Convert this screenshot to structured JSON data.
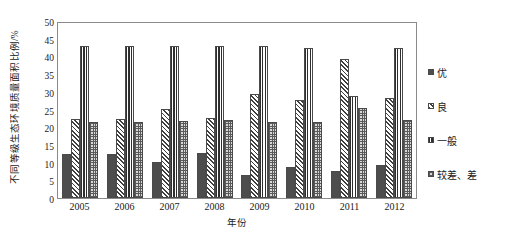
{
  "chart_data": {
    "type": "bar",
    "title": "",
    "xlabel": "年份",
    "ylabel": "不同等级生态环境质量面积比例/%",
    "ylim": [
      0,
      50
    ],
    "ytick_step": 5,
    "yticks": [
      "50",
      "45",
      "40",
      "35",
      "30",
      "25",
      "20",
      "15",
      "10",
      "5",
      "0"
    ],
    "grid": true,
    "legend_position": "right",
    "categories": [
      "2005",
      "2006",
      "2007",
      "2008",
      "2009",
      "2010",
      "2011",
      "2012"
    ],
    "series": [
      {
        "name": "优",
        "pattern": "solid-dark",
        "color": "#4d4d4d",
        "values": [
          12.4,
          12.5,
          10.3,
          12.6,
          6.4,
          8.9,
          7.7,
          9.3
        ]
      },
      {
        "name": "良",
        "pattern": "diagonal-hatch",
        "color": "#3f3f3f",
        "values": [
          22.2,
          22.2,
          25.1,
          22.5,
          29.5,
          27.6,
          39.4,
          28.3
        ]
      },
      {
        "name": "一般",
        "pattern": "vertical-stripes",
        "color": "#2e2e2e",
        "values": [
          43.0,
          43.0,
          43.0,
          43.0,
          43.0,
          42.4,
          28.7,
          42.5
        ]
      },
      {
        "name": "较差、差",
        "pattern": "checker",
        "color": "#5a5a5a",
        "values": [
          21.6,
          21.6,
          21.7,
          21.9,
          21.6,
          21.6,
          25.5,
          22.1
        ]
      }
    ]
  }
}
